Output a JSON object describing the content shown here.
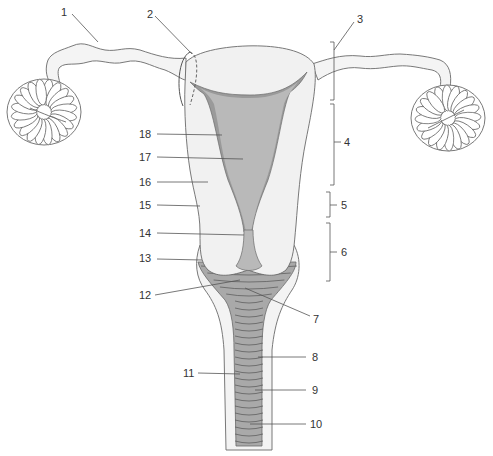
{
  "figure": {
    "type": "anatomical line drawing, unlabeled numbered callouts",
    "callouts": [
      {
        "id": "callout-1",
        "text": "1"
      },
      {
        "id": "callout-2",
        "text": "2"
      },
      {
        "id": "callout-3",
        "text": "3"
      },
      {
        "id": "callout-4",
        "text": "4"
      },
      {
        "id": "callout-5",
        "text": "5"
      },
      {
        "id": "callout-6",
        "text": "6"
      },
      {
        "id": "callout-7",
        "text": "7"
      },
      {
        "id": "callout-8",
        "text": "8"
      },
      {
        "id": "callout-9",
        "text": "9"
      },
      {
        "id": "callout-10",
        "text": "10"
      },
      {
        "id": "callout-11",
        "text": "11"
      },
      {
        "id": "callout-12",
        "text": "12"
      },
      {
        "id": "callout-13",
        "text": "13"
      },
      {
        "id": "callout-14",
        "text": "14"
      },
      {
        "id": "callout-15",
        "text": "15"
      },
      {
        "id": "callout-16",
        "text": "16"
      },
      {
        "id": "callout-17",
        "text": "17"
      },
      {
        "id": "callout-18",
        "text": "18"
      }
    ]
  },
  "colors": {
    "background": "#ffffff",
    "body_fill": "#f1f1f1",
    "cavity_fill": "#b9b9b9",
    "lining_fill": "#9a9a9a",
    "rugae_fill": "#a9a9a9",
    "outline": "#6a6a6a",
    "text": "#333333"
  }
}
